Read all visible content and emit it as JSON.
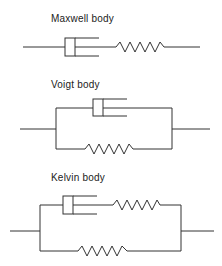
{
  "diagram": {
    "models": [
      {
        "name": "Maxwell body",
        "elements": [
          "dashpot",
          "spring"
        ],
        "arrangement": "series"
      },
      {
        "name": "Voigt body",
        "elements": [
          "dashpot",
          "spring"
        ],
        "arrangement": "parallel"
      },
      {
        "name": "Kelvin body",
        "elements": [
          "dashpot+spring (series)",
          "spring"
        ],
        "arrangement": "parallel"
      }
    ],
    "colors": {
      "stroke": "#333333",
      "background": "#ffffff"
    }
  }
}
